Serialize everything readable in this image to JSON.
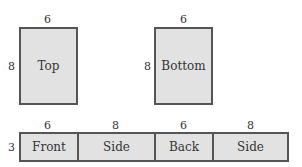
{
  "diagram": {
    "top_face": {
      "label": "Top",
      "width": "6",
      "height": "8"
    },
    "bottom_face": {
      "label": "Bottom",
      "width": "6",
      "height": "8"
    },
    "strip": {
      "height": "3",
      "cells": [
        {
          "label": "Front",
          "width": "6"
        },
        {
          "label": "Side",
          "width": "8"
        },
        {
          "label": "Back",
          "width": "6"
        },
        {
          "label": "Side",
          "width": "8"
        }
      ]
    },
    "colors": {
      "fill": "#e2e2e2",
      "stroke": "#555555"
    }
  }
}
